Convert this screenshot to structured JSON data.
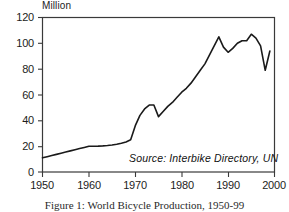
{
  "figure": {
    "caption": "Figure 1: World Bicycle Production, 1950-99",
    "unit_label": "Million",
    "source_note": "Source:  Interbike Directory, UN",
    "line_color": "#1a1a1a",
    "axis_color": "#3a3a3a",
    "background": "#ffffff"
  },
  "chart_data": {
    "type": "line",
    "title": "Figure 1: World Bicycle Production, 1950-99",
    "xlabel": "",
    "ylabel": "Million",
    "xlim": [
      1950,
      2000
    ],
    "ylim": [
      0,
      120
    ],
    "grid": false,
    "legend": "none",
    "xticks": [
      1950,
      1960,
      1970,
      1980,
      1990,
      2000
    ],
    "yticks": [
      0,
      20,
      40,
      60,
      80,
      100,
      120
    ],
    "annotations": [
      "Source:  Interbike Directory, UN"
    ],
    "series": [
      {
        "name": "World Bicycle Production",
        "x": [
          1950,
          1951,
          1952,
          1953,
          1954,
          1955,
          1956,
          1957,
          1958,
          1959,
          1960,
          1961,
          1962,
          1963,
          1964,
          1965,
          1966,
          1967,
          1968,
          1969,
          1970,
          1971,
          1972,
          1973,
          1974,
          1975,
          1976,
          1977,
          1978,
          1979,
          1980,
          1981,
          1982,
          1983,
          1984,
          1985,
          1986,
          1987,
          1988,
          1989,
          1990,
          1991,
          1992,
          1993,
          1994,
          1995,
          1996,
          1997,
          1998,
          1999
        ],
        "values": [
          11,
          11.9,
          12.8,
          13.7,
          14.6,
          15.5,
          16.4,
          17.3,
          18.2,
          19.1,
          20,
          20,
          20.1,
          20.3,
          20.6,
          21,
          21.6,
          22.4,
          23.3,
          25,
          36,
          44,
          49,
          52,
          52,
          43,
          47,
          51,
          54,
          58,
          62,
          65,
          69,
          74,
          79,
          84,
          91,
          98,
          105,
          97,
          93,
          96,
          100,
          102,
          102,
          107,
          104,
          98,
          79,
          94
        ]
      }
    ]
  },
  "axis": {
    "y_labels": [
      "120",
      "100",
      "80",
      "60",
      "40",
      "20",
      "0"
    ],
    "x_labels": [
      "1950",
      "1960",
      "1970",
      "1980",
      "1990",
      "2000"
    ]
  }
}
